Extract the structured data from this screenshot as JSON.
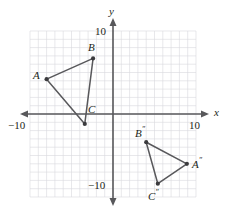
{
  "figure": {
    "axes": {
      "x_label": "x",
      "y_label": "y",
      "x_min_label": "−10",
      "x_max_label": "10",
      "y_max_label": "10",
      "y_min_label": "−10",
      "x_range": [
        -10,
        10
      ],
      "y_range": [
        -10,
        10
      ],
      "grid": true,
      "grid_step": 1,
      "grid_color": "#d9d9de",
      "axis_color": "#58585b"
    },
    "colors": {
      "grid": "#d9d9de",
      "axis": "#58585b",
      "shape_stroke": "#58585b",
      "vertex": "#3b3b3e",
      "text": "#231f20",
      "background": "#ffffff"
    },
    "shapes": [
      {
        "name": "triangle-abc",
        "vertices": [
          {
            "label": "A",
            "prime": "",
            "x": -8.0,
            "y": 4.2
          },
          {
            "label": "B",
            "prime": "",
            "x": -2.4,
            "y": 6.7
          },
          {
            "label": "C",
            "prime": "",
            "x": -3.4,
            "y": -1.2
          }
        ]
      },
      {
        "name": "triangle-abc-double-prime",
        "vertices": [
          {
            "label": "A",
            "prime": "″",
            "x": 8.9,
            "y": -6.0
          },
          {
            "label": "B",
            "prime": "″",
            "x": 4.0,
            "y": -3.4
          },
          {
            "label": "C",
            "prime": "″",
            "x": 5.4,
            "y": -8.4
          }
        ]
      }
    ],
    "point_labels": [
      {
        "name": "label-a",
        "text": "A",
        "prime": "",
        "left": 33,
        "top": 70
      },
      {
        "name": "label-b",
        "text": "B",
        "prime": "",
        "left": 88,
        "top": 42
      },
      {
        "name": "label-c",
        "text": "C",
        "prime": "",
        "left": 88,
        "top": 104
      },
      {
        "name": "label-b2",
        "text": "B",
        "prime": "″",
        "left": 135,
        "top": 126
      },
      {
        "name": "label-a2",
        "text": "A",
        "prime": "″",
        "left": 192,
        "top": 157
      },
      {
        "name": "label-c2",
        "text": "C",
        "prime": "″",
        "left": 148,
        "top": 189
      }
    ],
    "axis_labels": [
      {
        "name": "axis-label-y",
        "text": "y",
        "left": 109,
        "top": 6,
        "italic": true
      },
      {
        "name": "axis-label-x",
        "text": "x",
        "left": 214,
        "top": 107,
        "italic": true
      },
      {
        "name": "tick-label-y-10",
        "text": "10",
        "left": 95,
        "top": 26,
        "italic": false
      },
      {
        "name": "tick-label-y-neg10",
        "text": "−10",
        "left": 88,
        "top": 180,
        "italic": false
      },
      {
        "name": "tick-label-x-neg10",
        "text": "−10",
        "left": 8,
        "top": 120,
        "italic": false
      },
      {
        "name": "tick-label-x-10",
        "text": "10",
        "left": 189,
        "top": 120,
        "italic": false
      }
    ]
  }
}
